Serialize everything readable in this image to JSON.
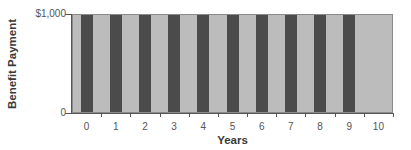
{
  "chart_data": {
    "type": "bar",
    "title": "",
    "xlabel": "Years",
    "ylabel": "Benefit Payment",
    "categories": [
      "0",
      "1",
      "2",
      "3",
      "4",
      "5",
      "6",
      "7",
      "8",
      "9",
      "10"
    ],
    "series": [
      {
        "name": "Benefit Payment",
        "values": [
          1000,
          1000,
          1000,
          1000,
          1000,
          1000,
          1000,
          1000,
          1000,
          1000,
          0
        ]
      }
    ],
    "yticks": [
      "0",
      "$1,000"
    ],
    "ylim": [
      0,
      1000
    ],
    "grid": false,
    "legend": null,
    "colors": {
      "bar": "#4b4b4b",
      "plot_background": "#bcbcbc"
    }
  }
}
